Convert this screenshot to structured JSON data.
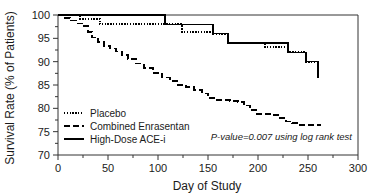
{
  "chart_data": {
    "type": "line",
    "title": "",
    "subtitle": "",
    "xlabel": "Day of Study",
    "ylabel": "Survival Rate (% of Patients)",
    "xlim": [
      0,
      300
    ],
    "ylim": [
      70,
      100
    ],
    "xticks": [
      0,
      50,
      100,
      150,
      200,
      250,
      300
    ],
    "xtick_labels": [
      "0",
      "50",
      "100",
      "150",
      "200",
      "250",
      "300"
    ],
    "yticks": [
      70,
      75,
      80,
      85,
      90,
      95,
      100
    ],
    "ytick_labels": [
      "70",
      "75",
      "80",
      "85",
      "90",
      "95",
      "100"
    ],
    "x_minor_ticks": [
      25,
      75,
      125,
      175,
      225,
      275
    ],
    "y_minor_ticks": [
      72.5,
      77.5,
      82.5,
      87.5,
      92.5,
      97.5
    ],
    "grid": false,
    "legend_position": "lower left",
    "annotation": "P-value=0.007 using log rank test",
    "step_type": "post",
    "series": [
      {
        "name": "Placebo",
        "style": "dotted",
        "color": "#000000",
        "x": [
          0,
          20,
          22,
          40,
          42,
          105,
          107,
          122,
          124,
          153,
          155,
          168,
          170,
          205,
          207,
          228,
          230,
          246,
          248,
          260
        ],
        "y": [
          100,
          100,
          99.2,
          99.2,
          98.0,
          98.0,
          98.0,
          98.0,
          96.4,
          96.4,
          96.0,
          96.0,
          94.0,
          94.0,
          93.2,
          93.2,
          92.0,
          92.0,
          90.0,
          90.0
        ]
      },
      {
        "name": "Combined Enrasentan",
        "style": "dashed",
        "color": "#000000",
        "x": [
          0,
          6,
          12,
          18,
          24,
          30,
          34,
          40,
          46,
          52,
          58,
          64,
          70,
          78,
          86,
          95,
          104,
          112,
          120,
          128,
          136,
          144,
          150,
          156,
          164,
          172,
          180,
          186,
          192,
          198,
          206,
          214,
          222,
          228,
          234,
          242,
          252,
          262
        ],
        "y": [
          100,
          99.4,
          98.8,
          98.2,
          97.6,
          96.4,
          95.2,
          94.2,
          93.4,
          92.8,
          92.2,
          91.4,
          90.6,
          89.6,
          88.6,
          87.6,
          86.6,
          85.8,
          85.0,
          84.6,
          84.0,
          83.2,
          82.2,
          81.8,
          81.8,
          81.6,
          81.4,
          80.6,
          79.6,
          78.8,
          78.8,
          78.6,
          78.0,
          77.2,
          76.8,
          76.4,
          76.4,
          76.3
        ]
      },
      {
        "name": "High-Dose ACE-i",
        "style": "solid",
        "color": "#000000",
        "x": [
          0,
          105,
          107,
          153,
          155,
          168,
          170,
          228,
          230,
          246,
          248,
          258,
          260
        ],
        "y": [
          100,
          100,
          98.0,
          98.0,
          96.0,
          96.0,
          94.0,
          94.0,
          92.0,
          92.0,
          90.0,
          90.0,
          86.5
        ]
      }
    ]
  },
  "legend": {
    "items": [
      {
        "label": "Placebo",
        "style": "dotted"
      },
      {
        "label": "Combined Enrasentan",
        "style": "dashed"
      },
      {
        "label": "High-Dose ACE-i",
        "style": "solid"
      }
    ]
  },
  "axes": {
    "x_title": "Day of Study",
    "y_title": "Survival Rate (% of Patients)"
  },
  "annotation": {
    "text": "P-value=0.007 using log rank test"
  },
  "colors": {
    "curve": "#000000",
    "frame": "#333333",
    "text": "#1a1a1a",
    "background": "#ffffff"
  }
}
